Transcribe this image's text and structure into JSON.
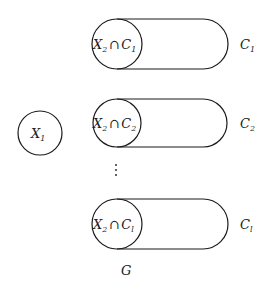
{
  "diagram": {
    "left_node": {
      "base": "X",
      "sub": "1"
    },
    "groups": [
      {
        "intersection": {
          "a": "X",
          "a_sub": "2",
          "op": "∩",
          "b": "C",
          "b_sub": "1"
        },
        "label": {
          "base": "C",
          "sub": "1"
        }
      },
      {
        "intersection": {
          "a": "X",
          "a_sub": "2",
          "op": "∩",
          "b": "C",
          "b_sub": "2"
        },
        "label": {
          "base": "C",
          "sub": "2"
        }
      },
      {
        "intersection": {
          "a": "X",
          "a_sub": "2",
          "op": "∩",
          "b": "C",
          "b_sub": "l"
        },
        "label": {
          "base": "C",
          "sub": "l"
        }
      }
    ],
    "ellipsis": "⋮",
    "caption": "G"
  }
}
